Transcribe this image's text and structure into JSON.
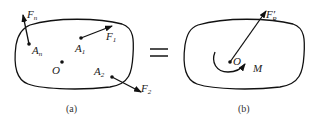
{
  "figure": {
    "panel_a": {
      "caption": "(a)",
      "origin_label": "O",
      "points": [
        {
          "name": "A",
          "sub": "n",
          "force": "F",
          "force_sub": "n"
        },
        {
          "name": "A",
          "sub": "1",
          "force": "F",
          "force_sub": "1"
        },
        {
          "name": "A",
          "sub": "2",
          "force": "F",
          "force_sub": "2"
        }
      ]
    },
    "equals_sign": "=",
    "panel_b": {
      "caption": "(b)",
      "origin_label": "O",
      "resultant_force": {
        "label": "F",
        "prime": "′",
        "sub": "R"
      },
      "moment_label": "M"
    }
  }
}
